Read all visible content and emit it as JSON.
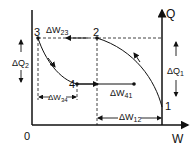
{
  "diagram": {
    "axes": {
      "x_label": "W",
      "y_label": "Q",
      "origin_label": "0"
    },
    "points": [
      {
        "id": "1",
        "label": "1"
      },
      {
        "id": "2",
        "label": "2"
      },
      {
        "id": "3",
        "label": "3"
      },
      {
        "id": "4",
        "label": "4"
      }
    ],
    "quantities": {
      "dQ1": "ΔQ",
      "dQ1_sub": "1",
      "dQ2": "ΔQ",
      "dQ2_sub": "2",
      "dW12": "ΔW",
      "dW12_sub": "12",
      "dW23": "ΔW",
      "dW23_sub": "23",
      "dW34": "ΔW",
      "dW34_sub": "34",
      "dW41": "ΔW",
      "dW41_sub": "41"
    },
    "colors": {
      "line": "#111111",
      "background": "#ffffff"
    }
  }
}
